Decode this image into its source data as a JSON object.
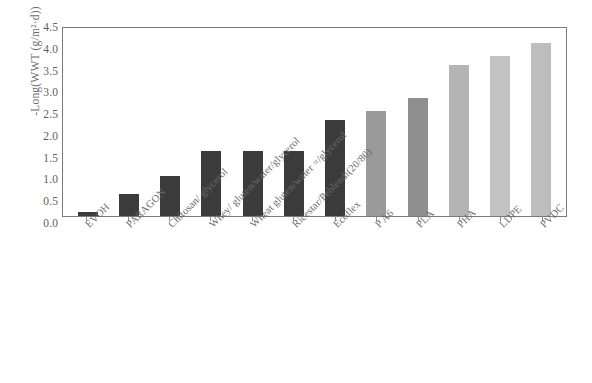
{
  "chart_data": {
    "type": "bar",
    "title": "",
    "xlabel": "",
    "ylabel": "-Long(WWT (g/m²·d))",
    "ylim": [
      0.0,
      4.5
    ],
    "ytick_labels": [
      "4.5",
      "4.0",
      "3.5",
      "3.0",
      "2.5",
      "2.0",
      "1.5",
      "1.0",
      "0.5",
      "0.0"
    ],
    "ytick_values": [
      4.5,
      4.0,
      3.5,
      3.0,
      2.5,
      2.0,
      1.5,
      1.0,
      0.5,
      0.0
    ],
    "grid": false,
    "legend": "none",
    "categories": [
      "EVOH",
      "PARAGON",
      "Chitosan/ glycerol",
      "Whey/ gluten/water/glycerol",
      "Wheat gluten/water =/glycerol",
      "Ricestar/Peblendi(20/80)",
      "Ecoflex",
      "P A6",
      "PLA",
      "PHA",
      "LDPE",
      "PVDC"
    ],
    "values": [
      0.1,
      0.52,
      0.95,
      1.55,
      1.55,
      1.55,
      2.3,
      2.52,
      2.82,
      3.62,
      3.82,
      4.15
    ],
    "bar_colors": [
      "#3b3b3b",
      "#3b3b3b",
      "#3b3b3b",
      "#3b3b3b",
      "#3b3b3b",
      "#3b3b3b",
      "#3b3b3b",
      "#9a9a9a",
      "#8f8f8f",
      "#b4b4b4",
      "#c2c2c2",
      "#bdbdbd"
    ]
  },
  "colors": {
    "frame": "#7a7a7a",
    "text": "#6a6a6a",
    "background": "#ffffff"
  }
}
